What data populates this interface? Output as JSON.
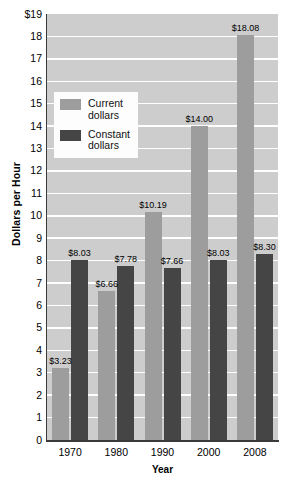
{
  "chart_data": {
    "type": "bar",
    "title": "",
    "xlabel": "Year",
    "ylabel": "Dollars per Hour",
    "categories": [
      "1970",
      "1980",
      "1990",
      "2000",
      "2008"
    ],
    "series": [
      {
        "name": "Current dollars",
        "color": "#9d9d9d",
        "values": [
          3.23,
          6.66,
          10.19,
          14.0,
          18.08
        ],
        "labels": [
          "$3.23",
          "$6.66",
          "$10.19",
          "$14.00",
          "$18.08"
        ]
      },
      {
        "name": "Constant dollars",
        "color": "#454545",
        "values": [
          8.03,
          7.78,
          7.66,
          8.03,
          8.3
        ],
        "labels": [
          "$8.03",
          "$7.78",
          "$7.66",
          "$8.03",
          "$8.30"
        ]
      }
    ],
    "ylim": [
      0,
      19
    ],
    "ytick_values": [
      19,
      18,
      17,
      16,
      15,
      14,
      13,
      12,
      11,
      10,
      9,
      8,
      7,
      6,
      5,
      4,
      3,
      2,
      1,
      0
    ],
    "ytick_labels": [
      "$19",
      "18",
      "17",
      "16",
      "15",
      "14",
      "13",
      "12",
      "11",
      "10",
      "9",
      "8",
      "7",
      "6",
      "5",
      "4",
      "3",
      "2",
      "1",
      "0"
    ],
    "grid": true,
    "legend_position": "upper-left-inside"
  },
  "legend": {
    "items": [
      {
        "label": "Current\ndollars",
        "swatch": "current"
      },
      {
        "label": "Constant\ndollars",
        "swatch": "constant"
      }
    ]
  },
  "colors": {
    "plot_background": "#cdcdcd",
    "gridline": "#ffffff",
    "axis": "#3a3a3a",
    "current_dollars": "#9d9d9d",
    "constant_dollars": "#454545",
    "legend_background": "#fdfdfd",
    "text": "#000000"
  }
}
